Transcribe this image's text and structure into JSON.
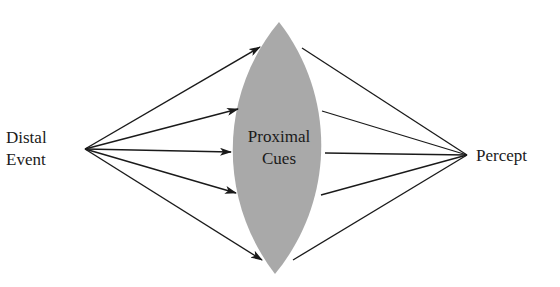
{
  "diagram": {
    "type": "lens-model",
    "colors": {
      "background": "#ffffff",
      "lens_fill": "#a9a9a9",
      "line": "#1a1a1a",
      "text": "#1a1a1a"
    },
    "left_node": {
      "line1": "Distal",
      "line2": "Event"
    },
    "center_node": {
      "line1": "Proximal",
      "line2": "Cues"
    },
    "right_node": {
      "label": "Percept"
    },
    "arrow_count": 5,
    "line_count": 5
  }
}
